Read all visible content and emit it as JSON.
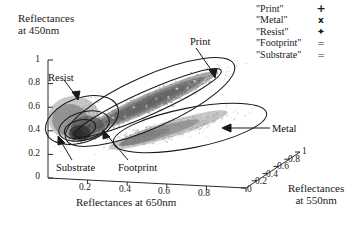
{
  "chart_data": {
    "type": "scatter",
    "title": "",
    "projection": "3d",
    "xlabel": "Reflectances at 650nm",
    "ylabel": "Reflectances at 450nm",
    "zlabel": "Reflectances at 550nm",
    "xticks": [
      "0",
      "0.2",
      "0.4",
      "0.6",
      "0.8",
      "1"
    ],
    "yticks": [
      "0",
      "0.2",
      "0.4",
      "0.6",
      "0.8",
      "1"
    ],
    "zticks": [
      "0",
      "0.2",
      "0.4",
      "0.6",
      "0.8",
      "1"
    ],
    "xlim": [
      0,
      1
    ],
    "ylim": [
      0,
      1
    ],
    "zlim": [
      0,
      1
    ],
    "grid": false,
    "legend_position": "top-right",
    "series": [
      {
        "name": "\"Print\"",
        "marker": "+",
        "marker_name": "plus-marker",
        "annotation": "Print",
        "cluster_center": [
          0.52,
          0.56,
          0.5
        ],
        "point_count": 1400,
        "color": "#555555"
      },
      {
        "name": "\"Metal\"",
        "marker": "x",
        "marker_name": "cross-marker",
        "annotation": "Metal",
        "cluster_center": [
          0.6,
          0.26,
          0.55
        ],
        "point_count": 900,
        "color": "#777777"
      },
      {
        "name": "\"Resist\"",
        "marker": "✦",
        "marker_name": "star-marker",
        "annotation": "Resist",
        "cluster_center": [
          0.13,
          0.33,
          0.12
        ],
        "point_count": 500,
        "color": "#444444"
      },
      {
        "name": "\"Footprint\"",
        "marker": "=",
        "marker_name": "equals-marker",
        "annotation": "Footprint",
        "cluster_center": [
          0.17,
          0.2,
          0.16
        ],
        "point_count": 420,
        "color": "#333333"
      },
      {
        "name": "\"Substrate\"",
        "marker": "=",
        "marker_name": "equals-marker",
        "annotation": "Substrate",
        "cluster_center": [
          0.09,
          0.14,
          0.08
        ],
        "point_count": 380,
        "color": "#222222"
      }
    ],
    "ellipses": [
      {
        "name": "print-outer-ellipse",
        "label": "Print"
      },
      {
        "name": "print-inner-ellipse",
        "label": "Print"
      },
      {
        "name": "metal-ellipse",
        "label": "Metal"
      },
      {
        "name": "resist-ellipse",
        "label": "Resist"
      },
      {
        "name": "footprint-ellipse",
        "label": "Footprint"
      },
      {
        "name": "substrate-ellipse",
        "label": "Substrate"
      }
    ]
  },
  "axes": {
    "y_title_line1": "Reflectances",
    "y_title_line2": "at 450nm",
    "x_title": "Reflectances at 650nm",
    "z_title_line1": "Reflectances",
    "z_title_line2": "at 550nm",
    "yticks": [
      "1",
      "0.8",
      "0.6",
      "0.4",
      "0.2",
      "0"
    ],
    "xticks": [
      "0.2",
      "0.4",
      "0.6",
      "0.8"
    ],
    "zticks": [
      "0",
      "0.2",
      "0.4",
      "0.6",
      "0.8",
      "1"
    ]
  },
  "annotations": {
    "print": "Print",
    "metal": "Metal",
    "resist": "Resist",
    "substrate": "Substrate",
    "footprint": "Footprint"
  },
  "legend": {
    "items": [
      {
        "label": "\"Print\"",
        "marker": "+",
        "marker_name": "plus-marker"
      },
      {
        "label": "\"Metal\"",
        "marker": "x",
        "marker_name": "cross-marker"
      },
      {
        "label": "\"Resist\"",
        "marker": "✦",
        "marker_name": "star-marker"
      },
      {
        "label": "\"Footprint\"",
        "marker": "=",
        "marker_name": "equals-marker"
      },
      {
        "label": "\"Substrate\"",
        "marker": "=",
        "marker_name": "equals-marker"
      }
    ]
  }
}
